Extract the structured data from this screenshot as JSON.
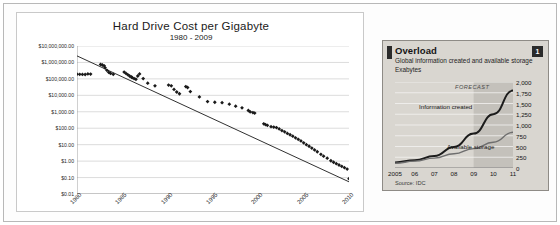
{
  "figure": {
    "background_color": "#ffffff",
    "frame_color": "#b8b8b8"
  },
  "chart_data": [
    {
      "id": "hard-drive-cost",
      "type": "scatter",
      "title": "Hard Drive Cost per Gigabyte",
      "subtitle": "1980 - 2009",
      "xlabel": "",
      "ylabel": "",
      "grid": true,
      "yscale": "log",
      "ylim": [
        0.01,
        10000000
      ],
      "xlim": [
        1980,
        2010
      ],
      "ytick_labels": [
        "$10,000,000.00",
        "$1,000,000.00",
        "$100,000.00",
        "$10,000.00",
        "$1,000.00",
        "$100.00",
        "$10.00",
        "$1.00",
        "$0.10",
        "$0.01"
      ],
      "ytick_values": [
        10000000,
        1000000,
        100000,
        10000,
        1000,
        100,
        10,
        1,
        0.1,
        0.01
      ],
      "xtick_labels": [
        "1980",
        "1985",
        "1990",
        "1995",
        "2000",
        "2005",
        "2010"
      ],
      "xtick_values": [
        1980,
        1985,
        1990,
        1995,
        2000,
        2005,
        2010
      ],
      "marker_color": "#1a1a1a",
      "trendline_color": "#1a1a1a",
      "trendline": {
        "x": [
          1980,
          2010
        ],
        "y": [
          2500000,
          0.055
        ]
      },
      "points": [
        {
          "x": 1980.0,
          "y": 193000
        },
        {
          "x": 1980.3,
          "y": 190000
        },
        {
          "x": 1980.6,
          "y": 188000
        },
        {
          "x": 1980.9,
          "y": 185000
        },
        {
          "x": 1981.2,
          "y": 200000
        },
        {
          "x": 1981.5,
          "y": 195000
        },
        {
          "x": 1982.6,
          "y": 760000
        },
        {
          "x": 1982.8,
          "y": 700000
        },
        {
          "x": 1983.0,
          "y": 620000
        },
        {
          "x": 1983.1,
          "y": 470000
        },
        {
          "x": 1983.3,
          "y": 330000
        },
        {
          "x": 1983.5,
          "y": 250000
        },
        {
          "x": 1983.7,
          "y": 215000
        },
        {
          "x": 1984.0,
          "y": 190000
        },
        {
          "x": 1985.2,
          "y": 260000
        },
        {
          "x": 1985.4,
          "y": 215000
        },
        {
          "x": 1985.6,
          "y": 180000
        },
        {
          "x": 1985.8,
          "y": 150000
        },
        {
          "x": 1986.0,
          "y": 130000
        },
        {
          "x": 1986.1,
          "y": 118000
        },
        {
          "x": 1986.3,
          "y": 105000
        },
        {
          "x": 1986.5,
          "y": 95000
        },
        {
          "x": 1986.7,
          "y": 150000
        },
        {
          "x": 1986.9,
          "y": 200000
        },
        {
          "x": 1987.3,
          "y": 105000
        },
        {
          "x": 1987.8,
          "y": 55000
        },
        {
          "x": 1988.6,
          "y": 38000
        },
        {
          "x": 1990.1,
          "y": 42000
        },
        {
          "x": 1990.4,
          "y": 38000
        },
        {
          "x": 1990.7,
          "y": 23000
        },
        {
          "x": 1991.0,
          "y": 16000
        },
        {
          "x": 1991.3,
          "y": 12500
        },
        {
          "x": 1992.0,
          "y": 34000
        },
        {
          "x": 1992.2,
          "y": 30000
        },
        {
          "x": 1992.5,
          "y": 17000
        },
        {
          "x": 1993.5,
          "y": 8000
        },
        {
          "x": 1994.4,
          "y": 4200
        },
        {
          "x": 1995.2,
          "y": 3800
        },
        {
          "x": 1996.0,
          "y": 3600
        },
        {
          "x": 1996.8,
          "y": 2900
        },
        {
          "x": 1997.5,
          "y": 2200
        },
        {
          "x": 1998.2,
          "y": 1750
        },
        {
          "x": 1998.9,
          "y": 1200
        },
        {
          "x": 1999.1,
          "y": 1000
        },
        {
          "x": 1999.4,
          "y": 900
        },
        {
          "x": 1999.6,
          "y": 830
        },
        {
          "x": 2000.6,
          "y": 185
        },
        {
          "x": 2000.8,
          "y": 165
        },
        {
          "x": 2001.0,
          "y": 150
        },
        {
          "x": 2001.4,
          "y": 125
        },
        {
          "x": 2001.7,
          "y": 118
        },
        {
          "x": 2002.0,
          "y": 110
        },
        {
          "x": 2002.3,
          "y": 90
        },
        {
          "x": 2002.6,
          "y": 72
        },
        {
          "x": 2002.9,
          "y": 60
        },
        {
          "x": 2003.2,
          "y": 48
        },
        {
          "x": 2003.5,
          "y": 40
        },
        {
          "x": 2003.8,
          "y": 33
        },
        {
          "x": 2004.1,
          "y": 26
        },
        {
          "x": 2004.4,
          "y": 21
        },
        {
          "x": 2004.7,
          "y": 17
        },
        {
          "x": 2005.0,
          "y": 13
        },
        {
          "x": 2005.3,
          "y": 10
        },
        {
          "x": 2005.6,
          "y": 8
        },
        {
          "x": 2005.9,
          "y": 6.2
        },
        {
          "x": 2006.2,
          "y": 4.8
        },
        {
          "x": 2006.5,
          "y": 3.7
        },
        {
          "x": 2006.9,
          "y": 2.6
        },
        {
          "x": 2007.2,
          "y": 2.0
        },
        {
          "x": 2007.6,
          "y": 1.5
        },
        {
          "x": 2008.0,
          "y": 1.05
        },
        {
          "x": 2008.3,
          "y": 0.85
        },
        {
          "x": 2008.6,
          "y": 0.7
        },
        {
          "x": 2008.9,
          "y": 0.58
        },
        {
          "x": 2009.2,
          "y": 0.48
        },
        {
          "x": 2009.5,
          "y": 0.4
        },
        {
          "x": 2009.8,
          "y": 0.33
        },
        {
          "x": 2010.0,
          "y": 0.085
        }
      ]
    },
    {
      "id": "overload",
      "type": "line",
      "title": "Overload",
      "subtitle": "Global information created and available storage",
      "unit_label": "Exabytes",
      "badge": "1",
      "source": "Source: IDC",
      "grid": true,
      "ylim": [
        0,
        2000
      ],
      "ytick_labels": [
        "2,000",
        "1,750",
        "1,500",
        "1,250",
        "1,000",
        "750",
        "500",
        "250",
        "0"
      ],
      "ytick_values": [
        2000,
        1750,
        1500,
        1250,
        1000,
        750,
        500,
        250,
        0
      ],
      "xtick_labels": [
        "2005",
        "06",
        "07",
        "08",
        "09",
        "10",
        "11"
      ],
      "x": [
        2005,
        2006,
        2007,
        2008,
        2009,
        2010,
        2011
      ],
      "forecast_label": "FORECAST",
      "forecast_start": 2009,
      "series": [
        {
          "name": "Information created",
          "values": [
            130,
            180,
            280,
            490,
            800,
            1250,
            1800
          ],
          "color": "#1c1c1c"
        },
        {
          "name": "Available storage",
          "values": [
            110,
            160,
            230,
            330,
            450,
            600,
            830
          ],
          "color": "#6e6e6e"
        }
      ],
      "panel_background": "#d9d6d0",
      "forecast_shade": "#c4c1bb"
    }
  ]
}
